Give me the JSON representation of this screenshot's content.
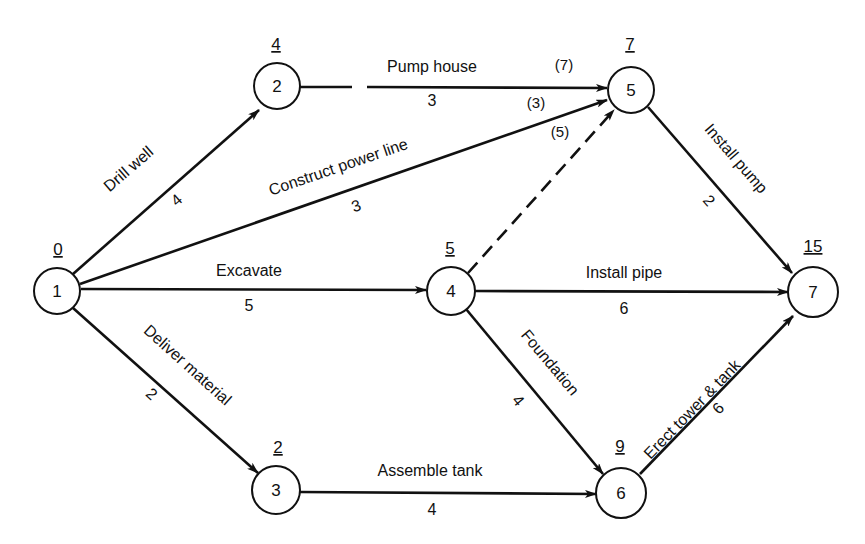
{
  "nodes": [
    {
      "id": "1",
      "label": "1",
      "earliest_time": "0"
    },
    {
      "id": "2",
      "label": "2",
      "earliest_time": "4"
    },
    {
      "id": "3",
      "label": "3",
      "earliest_time": "2"
    },
    {
      "id": "4",
      "label": "4",
      "earliest_time": "5"
    },
    {
      "id": "5",
      "label": "5",
      "earliest_time": "7"
    },
    {
      "id": "6",
      "label": "6",
      "earliest_time": "9"
    },
    {
      "id": "7",
      "label": "7",
      "earliest_time": "15"
    }
  ],
  "edges": [
    {
      "from": "1",
      "to": "2",
      "activity": "Drill well",
      "duration": "4",
      "style": "solid"
    },
    {
      "from": "2",
      "to": "5",
      "activity": "Pump house",
      "duration": "3",
      "style": "broken"
    },
    {
      "from": "1",
      "to": "5",
      "activity": "Construct power line",
      "duration": "3",
      "style": "solid"
    },
    {
      "from": "1",
      "to": "4",
      "activity": "Excavate",
      "duration": "5",
      "style": "solid"
    },
    {
      "from": "4",
      "to": "5",
      "activity": "",
      "duration": "",
      "style": "dashed-dummy"
    },
    {
      "from": "1",
      "to": "3",
      "activity": "Deliver material",
      "duration": "2",
      "style": "solid"
    },
    {
      "from": "3",
      "to": "6",
      "activity": "Assemble tank",
      "duration": "4",
      "style": "solid"
    },
    {
      "from": "4",
      "to": "7",
      "activity": "Install pipe",
      "duration": "6",
      "style": "solid"
    },
    {
      "from": "4",
      "to": "6",
      "activity": "Foundation",
      "duration": "4",
      "style": "solid"
    },
    {
      "from": "5",
      "to": "7",
      "activity": "Install pump",
      "duration": "2",
      "style": "solid"
    },
    {
      "from": "6",
      "to": "7",
      "activity": "Erect tower & tank",
      "duration": "6",
      "style": "solid"
    }
  ],
  "node5_incoming_times": {
    "from_pump_house": "(7)",
    "from_power_line": "(3)",
    "from_dummy": "(5)"
  }
}
